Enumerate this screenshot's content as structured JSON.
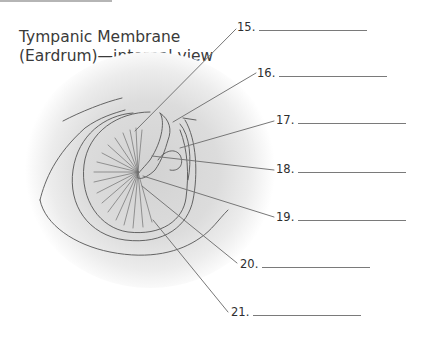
{
  "title": {
    "line1": "Tympanic Membrane",
    "line2": "(Eardrum)—internal view"
  },
  "labels": [
    {
      "number": "15.",
      "answer": ""
    },
    {
      "number": "16.",
      "answer": ""
    },
    {
      "number": "17.",
      "answer": ""
    },
    {
      "number": "18.",
      "answer": ""
    },
    {
      "number": "19.",
      "answer": ""
    },
    {
      "number": "20.",
      "answer": ""
    },
    {
      "number": "21.",
      "answer": ""
    }
  ],
  "colors": {
    "line": "#6f6f6f",
    "sketch": "#555555",
    "shadow": "#c8c8c8",
    "text": "#2e2e2e"
  }
}
